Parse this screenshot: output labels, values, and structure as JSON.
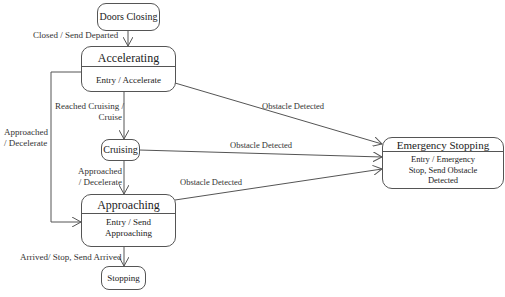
{
  "diagram": {
    "type": "state-machine",
    "states": [
      {
        "id": "doors_closing",
        "name": "Doors Closing"
      },
      {
        "id": "accelerating",
        "name": "Accelerating",
        "entry": "Entry / Accelerate"
      },
      {
        "id": "cruising",
        "name": "Cruising"
      },
      {
        "id": "approaching",
        "name": "Approaching",
        "entry_line1": "Entry / Send",
        "entry_line2": "Approaching"
      },
      {
        "id": "stopping",
        "name": "Stopping"
      },
      {
        "id": "emergency_stopping",
        "name": "Emergency Stopping",
        "entry_line1": "Entry / Emergency",
        "entry_line2": "Stop, Send Obstacle",
        "entry_line3": "Detected"
      }
    ],
    "transitions": [
      {
        "from": "doors_closing",
        "to": "accelerating",
        "label": "Closed / Send Departed"
      },
      {
        "from": "accelerating",
        "to": "cruising",
        "label_line1": "Reached Cruising /",
        "label_line2": "Cruise"
      },
      {
        "from": "accelerating",
        "to": "approaching",
        "label_line1": "Approached",
        "label_line2": "/ Decelerate"
      },
      {
        "from": "cruising",
        "to": "approaching",
        "label_line1": "Approached",
        "label_line2": "/ Decelerate"
      },
      {
        "from": "approaching",
        "to": "stopping",
        "label": "Arrived/ Stop, Send Arrived"
      },
      {
        "from": "accelerating",
        "to": "emergency_stopping",
        "label": "Obstacle Detected"
      },
      {
        "from": "cruising",
        "to": "emergency_stopping",
        "label": "Obstacle Detected"
      },
      {
        "from": "approaching",
        "to": "emergency_stopping",
        "label": "Obstacle Detected"
      }
    ]
  }
}
